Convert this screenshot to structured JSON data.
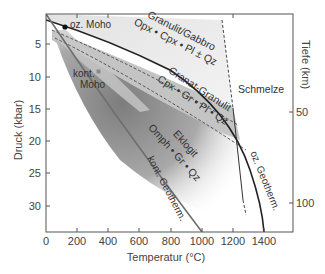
{
  "figure": {
    "x_axis": {
      "title": "Temperatur (°C)",
      "ticks": [
        "0",
        "200",
        "400",
        "600",
        "800",
        "1000",
        "1200",
        "1400"
      ]
    },
    "y_axis_left": {
      "title": "Druck (kbar)",
      "ticks": [
        "5",
        "10",
        "15",
        "20",
        "25",
        "30"
      ]
    },
    "y_axis_right": {
      "title": "Tiefe (km)",
      "ticks": [
        "50",
        "100"
      ]
    },
    "fields": {
      "granulite": {
        "name": "Granulit/Gabbro",
        "assemblage": "Opx • Cpx • Pl ± Qz"
      },
      "garnet_granulite": {
        "name": "Granat-Granulit",
        "assemblage": "Cpx • Gr • Pl • Qz"
      },
      "eclogite": {
        "name": "Eklogit",
        "assemblage": "Omph • Gr • Qz"
      },
      "melt": {
        "name": "Schmelze"
      }
    },
    "lines": {
      "oceanic_moho": "oz. Moho",
      "continental_moho_1": "kont.",
      "continental_moho_2": "Moho",
      "continental_geotherm": "kont. Geotherm.",
      "oceanic_geotherm": "oz. Geotherm."
    },
    "colors": {
      "frame": "#555555",
      "curve": "#333333",
      "granulite_fill": "#ebebeb",
      "garnet_granulite_fill": "#bdbdbd",
      "eclogite_dark": "#8a8a8a",
      "continental_band": "#c8c8c8",
      "geotherm_cont": "#6e6e6e"
    }
  }
}
